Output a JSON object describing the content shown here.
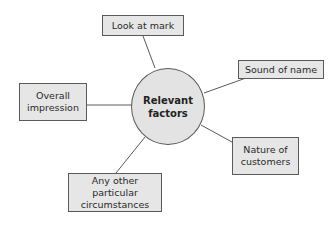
{
  "diagram": {
    "type": "hub-and-spoke",
    "center": {
      "label": "Relevant\nfactors"
    },
    "nodes": [
      {
        "id": "look",
        "label": "Look at mark"
      },
      {
        "id": "sound",
        "label": "Sound of name"
      },
      {
        "id": "overall",
        "label": "Overall\nimpression"
      },
      {
        "id": "nature",
        "label": "Nature of\ncustomers"
      },
      {
        "id": "other",
        "label": "Any other particular\ncircumstances"
      }
    ],
    "colors": {
      "box_fill": "#e6e6e6",
      "hub_fill": "#e3e3e3",
      "stroke": "#5a5a5a",
      "background": "#ffffff"
    }
  }
}
